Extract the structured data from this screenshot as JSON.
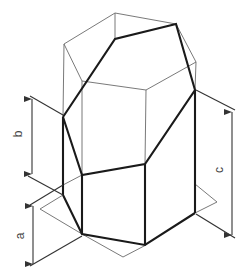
{
  "figure": {
    "labels": {
      "a": "a",
      "b": "b",
      "c": "c"
    },
    "colors": {
      "thin_line": "#6a6a6a",
      "thick_line": "#1a1a1a",
      "dimension": "#333333",
      "background": "#ffffff"
    }
  }
}
